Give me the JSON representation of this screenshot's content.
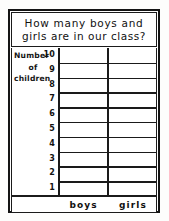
{
  "chart_data": {
    "type": "bar",
    "title": "How many boys and girls are in our class?",
    "title_lines": [
      "How many boys and",
      "girls are in our class?"
    ],
    "categories": [
      "boys",
      "girls"
    ],
    "values": [
      10,
      7
    ],
    "xlabel": "",
    "ylabel": "Number of children",
    "ylabel_lines": [
      "Number",
      "of",
      "children"
    ],
    "ylim": [
      0,
      10
    ],
    "ytick_labels": [
      "10",
      "9",
      "8",
      "7",
      "6",
      "5",
      "4",
      "3",
      "2",
      "1"
    ],
    "grid": true,
    "legend": "none",
    "style": "hand-drawn worksheet, diagonal hatch fill",
    "colors": {
      "ink": "#141414",
      "paper": "#ffffff",
      "hatch": "#111111"
    }
  },
  "worksheet": {
    "title_box_lines": [
      "How many boys and",
      "girls are in our class?"
    ],
    "axis_label": {
      "line1": "Number",
      "line2": "of",
      "line3": "children"
    },
    "bottom_labels": {
      "blank": "",
      "boys": "boys",
      "girls": "girls"
    }
  }
}
